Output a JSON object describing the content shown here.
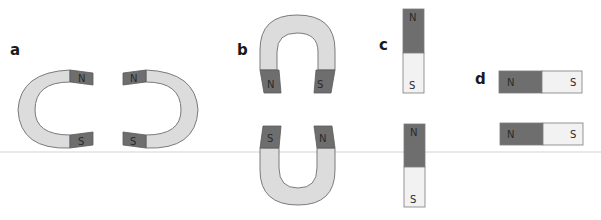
{
  "colors": {
    "north": "#6e6e6e",
    "south_bar": "#f2f2f2",
    "horseshoe_body": "#dcdcdc",
    "outline": "#7a7a7a",
    "divider": "#cfcfcf"
  },
  "panels": {
    "a": {
      "label": "a",
      "left": {
        "top": "N",
        "bottom": "S"
      },
      "right": {
        "top": "N",
        "bottom": "S"
      }
    },
    "b": {
      "label": "b",
      "top": {
        "left": "N",
        "right": "S"
      },
      "bottom": {
        "left": "S",
        "right": "N"
      }
    },
    "c": {
      "label": "c",
      "upper": {
        "top": "N",
        "bottom": "S"
      },
      "lower": {
        "top": "N",
        "bottom": "S"
      }
    },
    "d": {
      "label": "d",
      "upper": {
        "left": "N",
        "right": "S"
      },
      "lower": {
        "left": "N",
        "right": "S"
      }
    }
  }
}
